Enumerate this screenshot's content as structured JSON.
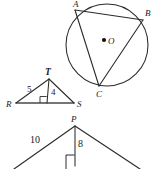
{
  "figure": {
    "ink_color": "#2b2b2b",
    "paper_color": "#ffffff",
    "circle_figure": {
      "name": "inscribed-triangle-in-circle",
      "center_label": "O",
      "vertices": [
        {
          "label": "A",
          "x": 77,
          "y": 9
        },
        {
          "label": "B",
          "x": 144,
          "y": 17
        },
        {
          "label": "C",
          "x": 101,
          "y": 92
        }
      ],
      "circle": {
        "cx": 107,
        "cy": 45,
        "r": 41
      },
      "center_dot": {
        "cx": 104,
        "cy": 40
      },
      "chords": [
        {
          "from": "A",
          "to": "B"
        },
        {
          "from": "A",
          "to": "C"
        },
        {
          "from": "B",
          "to": "C"
        }
      ]
    },
    "triangle_rst": {
      "name": "triangle-RST",
      "vertices": [
        {
          "label": "R",
          "x": 12,
          "y": 104
        },
        {
          "label": "S",
          "x": 78,
          "y": 104
        },
        {
          "label": "T",
          "x": 49,
          "y": 76
        }
      ],
      "altitude_foot": {
        "x": 45,
        "y": 104
      },
      "side_label": "5",
      "altitude_label": "4",
      "right_angle_marked": true
    },
    "triangle_p": {
      "name": "triangle-with-apex-P",
      "apex_label": "P",
      "apex": {
        "x": 75,
        "y": 123
      },
      "left_end": {
        "x": 13,
        "y": 169
      },
      "right_end": {
        "x": 141,
        "y": 169
      },
      "altitude_foot": {
        "x": 75,
        "y": 165
      },
      "side_label": "10",
      "altitude_label": "8",
      "right_angle_marked": true,
      "clipped_at_bottom": true
    }
  }
}
